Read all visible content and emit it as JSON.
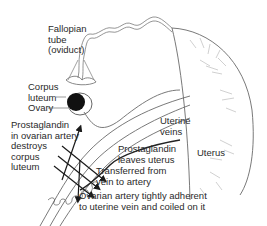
{
  "diagram": {
    "type": "anatomical-illustration",
    "colors": {
      "line": "#6a6a6a",
      "dark": "#1a1a1a",
      "faint": "#b0b0b0",
      "text": "#2a2a2a"
    },
    "labels": {
      "fallopian_tube": "Fallopian\ntube\n(oviduct)",
      "corpus_luteum": "Corpus\nluteum",
      "ovary": "Ovary",
      "prostaglandin_destroys": "Prostaglandin\nin ovarian artery\ndestroys\ncorpus\nluteum",
      "uterine_veins": "Uterine\nveins",
      "prostaglandin_leaves": "Prostaglandin\nleaves uterus",
      "transferred": "Transferred from\nvein to artery",
      "uterus": "Uterus",
      "ovarian_artery": "Ovarian artery tightly adherent\nto uterine vein and coiled on it"
    }
  }
}
